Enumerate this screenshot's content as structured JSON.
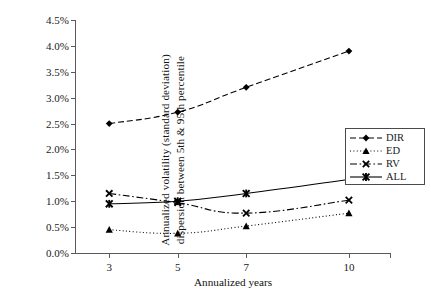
{
  "chart_data": {
    "type": "line",
    "title": "",
    "xlabel": "Annualized years",
    "ylabel": "Annualized volatility (standard  deviation) dispersion between 5th & 95th percentile",
    "ylabel_line1": "Annualized volatility (standard  deviation)",
    "ylabel_line2": "dispersion between 5th & 95th percentile",
    "x": [
      3,
      5,
      7,
      10
    ],
    "categories": [
      "3",
      "5",
      "7",
      "10"
    ],
    "xtick_labels": [
      "3",
      "5",
      "7",
      "10"
    ],
    "ytick_labels": [
      "0.0%",
      "0.5%",
      "1.0%",
      "1.5%",
      "2.0%",
      "2.5%",
      "3.0%",
      "3.5%",
      "4.0%",
      "4.5%"
    ],
    "ytick_values": [
      0.0,
      0.5,
      1.0,
      1.5,
      2.0,
      2.5,
      3.0,
      3.5,
      4.0,
      4.5
    ],
    "ylim": [
      0.0,
      4.5
    ],
    "xlim": [
      2.0,
      11.2
    ],
    "grid": false,
    "legend_position": "right-middle",
    "series": [
      {
        "name": "DIR",
        "values": [
          2.5,
          2.72,
          3.2,
          3.9
        ],
        "marker": "diamond",
        "dash": "dashed",
        "color": "#000000"
      },
      {
        "name": "ED",
        "values": [
          0.45,
          0.38,
          0.52,
          0.77
        ],
        "marker": "triangle",
        "dash": "dotted",
        "color": "#000000"
      },
      {
        "name": "RV",
        "values": [
          1.15,
          0.97,
          0.77,
          1.02
        ],
        "marker": "x",
        "dash": "dashdot",
        "color": "#000000"
      },
      {
        "name": "ALL",
        "values": [
          0.95,
          1.0,
          1.15,
          1.42
        ],
        "marker": "asterisk",
        "dash": "solid",
        "color": "#000000"
      }
    ]
  },
  "legend": {
    "entries": [
      {
        "label": "DIR"
      },
      {
        "label": "ED"
      },
      {
        "label": "RV"
      },
      {
        "label": "ALL"
      }
    ]
  },
  "axes": {
    "x_title": "Annualized years",
    "y_title_line1": "Annualized volatility (standard  deviation)",
    "y_title_line2": "dispersion between 5th & 95th percentile"
  },
  "colors": {
    "axis": "#5a5a5a",
    "ink": "#000000",
    "background": "#ffffff"
  }
}
